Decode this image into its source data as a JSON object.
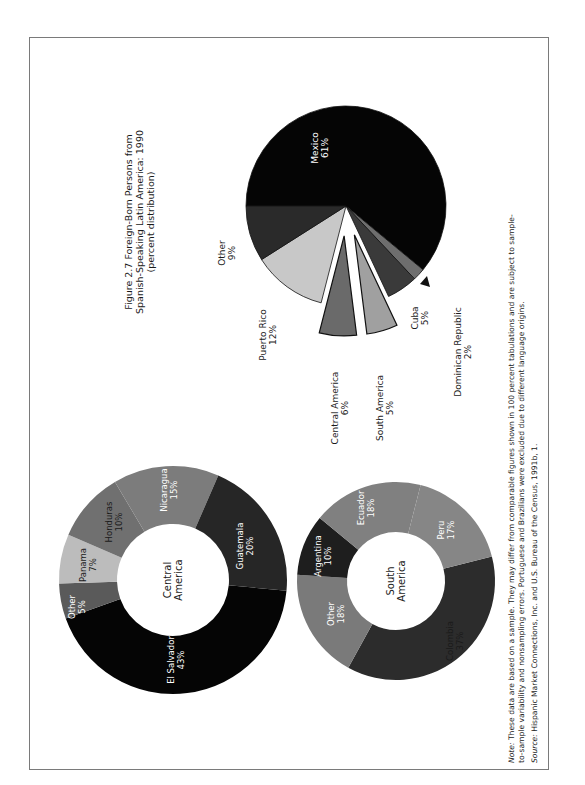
{
  "figure": {
    "title_lines": [
      "Figure 2.7  Foreign-Born Persons from",
      "Spanish-Speaking Latin America:  1990",
      "(percent distribution)"
    ],
    "note_label": "Note:",
    "note_lines": [
      "These data are based on a sample. They may differ from comparable figures shown in 100 percent tabulations and are subject to sample-",
      "to-sample variability and nonsampling errors. Portuguese and Brazilians were excluded due to different language origins."
    ],
    "source_label": "Source:",
    "source_text": "Hispanic Market Connections, Inc. and U.S. Bureau of the Census, 1991b, 1."
  },
  "colors": {
    "black": "#050505",
    "dark": "#2a2a2a",
    "mid_dark": "#3c3c3c",
    "mid": "#6e6e6e",
    "light_mid": "#9a9a9a",
    "light": "#c8c8c8",
    "frame": "#7a7a7a",
    "text": "#1a1a1a"
  },
  "chart_data": [
    {
      "type": "pie",
      "title": "Foreign-Born Persons from Spanish-Speaking Latin America: 1990 (percent distribution)",
      "categories": [
        "Mexico",
        "Dominican Republic",
        "Cuba",
        "South America",
        "Central America",
        "Puerto Rico",
        "Other"
      ],
      "values": [
        61,
        2,
        5,
        5,
        6,
        12,
        9
      ],
      "labels": [
        "61%",
        "2%",
        "5%",
        "5%",
        "6%",
        "12%",
        "9%"
      ],
      "exploded": [
        "South America",
        "Central America"
      ],
      "fills": [
        "#050505",
        "#6e6e6e",
        "#3a3a3a",
        "#a0a0a0",
        "#6a6a6a",
        "#c8c8c8",
        "#2a2a2a"
      ]
    },
    {
      "type": "pie",
      "title": "Central America",
      "center_label": [
        "Central",
        "America"
      ],
      "donut": true,
      "categories": [
        "El Salvador",
        "Other",
        "Panama",
        "Honduras",
        "Nicaragua",
        "Guatemala"
      ],
      "values": [
        43,
        5,
        7,
        10,
        15,
        20
      ],
      "labels": [
        "43%",
        "5%",
        "7%",
        "10%",
        "15%",
        "20%"
      ],
      "fills": [
        "#050505",
        "#5a5a5a",
        "#bcbcbc",
        "#707070",
        "#7c7c7c",
        "#262626"
      ]
    },
    {
      "type": "pie",
      "title": "South America",
      "center_label": [
        "South",
        "America"
      ],
      "donut": true,
      "categories": [
        "Colombia",
        "Other",
        "Argentina",
        "Ecuador",
        "Peru"
      ],
      "values": [
        37,
        18,
        10,
        18,
        17
      ],
      "labels": [
        "37%",
        "18%",
        "10%",
        "18%",
        "17%"
      ],
      "fills": [
        "#2c2c2c",
        "#7a7a7a",
        "#1e1e1e",
        "#808080",
        "#868686"
      ]
    }
  ]
}
